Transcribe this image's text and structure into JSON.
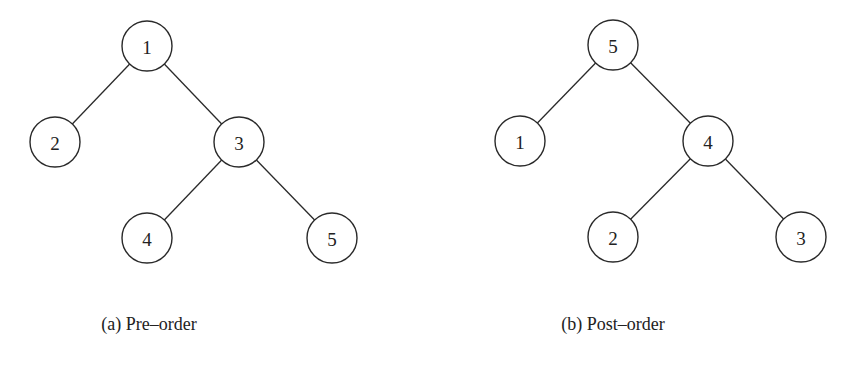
{
  "figures": [
    {
      "id": "a",
      "caption": "(a) Pre–order",
      "caption_x": 149,
      "nodes": [
        {
          "label": "1",
          "x": 147,
          "y": 46
        },
        {
          "label": "2",
          "x": 55,
          "y": 142
        },
        {
          "label": "3",
          "x": 239,
          "y": 142
        },
        {
          "label": "4",
          "x": 147,
          "y": 238
        },
        {
          "label": "5",
          "x": 332,
          "y": 238
        }
      ],
      "edges": [
        [
          0,
          1
        ],
        [
          0,
          2
        ],
        [
          2,
          3
        ],
        [
          2,
          4
        ]
      ]
    },
    {
      "id": "b",
      "caption": "(b) Post–order",
      "caption_x": 613,
      "nodes": [
        {
          "label": "5",
          "x": 613,
          "y": 45
        },
        {
          "label": "1",
          "x": 520,
          "y": 141
        },
        {
          "label": "4",
          "x": 708,
          "y": 141
        },
        {
          "label": "2",
          "x": 613,
          "y": 237
        },
        {
          "label": "3",
          "x": 801,
          "y": 237
        }
      ],
      "edges": [
        [
          0,
          1
        ],
        [
          0,
          2
        ],
        [
          2,
          3
        ],
        [
          2,
          4
        ]
      ]
    }
  ],
  "node_radius": 25
}
